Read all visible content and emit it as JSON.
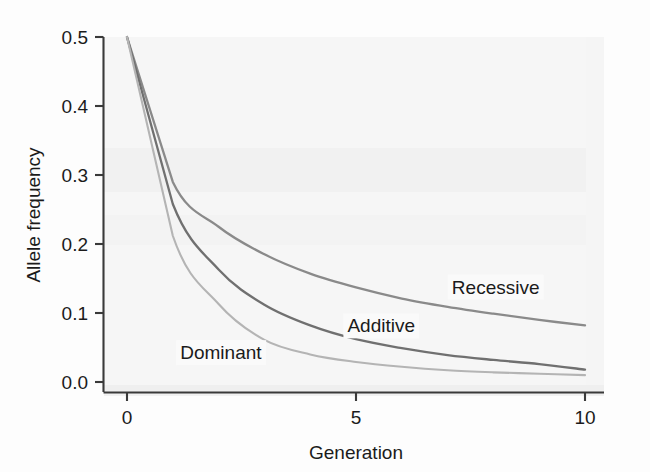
{
  "chart_data": {
    "type": "line",
    "title": "",
    "xlabel": "Generation",
    "ylabel": "Allele frequency",
    "xlim": [
      0,
      10
    ],
    "ylim": [
      0.0,
      0.5
    ],
    "x_ticks": [
      0,
      5,
      10
    ],
    "x_tick_labels": [
      "0",
      "5",
      "10"
    ],
    "y_ticks": [
      0.0,
      0.1,
      0.2,
      0.3,
      0.4,
      0.5
    ],
    "y_tick_labels": [
      "0.0",
      "0.1",
      "0.2",
      "0.3",
      "0.4",
      "0.5"
    ],
    "grid": false,
    "legend": "inline-labels",
    "x": [
      0,
      1,
      2,
      3,
      4,
      5,
      6,
      7,
      8,
      9,
      10
    ],
    "series": [
      {
        "name": "Recessive",
        "color": "#8a8a8a",
        "label_x": 8.05,
        "label_y": 0.128,
        "values": [
          0.5,
          0.29,
          0.225,
          0.185,
          0.157,
          0.137,
          0.121,
          0.109,
          0.099,
          0.09,
          0.082
        ]
      },
      {
        "name": "Additive",
        "color": "#707070",
        "label_x": 5.55,
        "label_y": 0.072,
        "values": [
          0.5,
          0.258,
          0.163,
          0.112,
          0.082,
          0.062,
          0.049,
          0.039,
          0.032,
          0.026,
          0.018
        ]
      },
      {
        "name": "Dominant",
        "color": "#b4b4b4",
        "label_x": 2.05,
        "label_y": 0.033,
        "values": [
          0.5,
          0.212,
          0.113,
          0.061,
          0.04,
          0.029,
          0.022,
          0.017,
          0.014,
          0.012,
          0.01
        ]
      }
    ],
    "annotations": [
      {
        "text": "Recessive",
        "series": "Recessive"
      },
      {
        "text": "Additive",
        "series": "Additive"
      },
      {
        "text": "Dominant",
        "series": "Dominant"
      }
    ]
  },
  "axes": {
    "y_title": "Allele frequency",
    "x_title": "Generation"
  },
  "colors": {
    "recessive": "#8a8a8a",
    "additive": "#707070",
    "dominant": "#b4b4b4",
    "axis": "#3a3a3a",
    "text": "#1b1b1b",
    "plot_background": "#f6f6f6",
    "page_background": "#fdfdfd"
  }
}
